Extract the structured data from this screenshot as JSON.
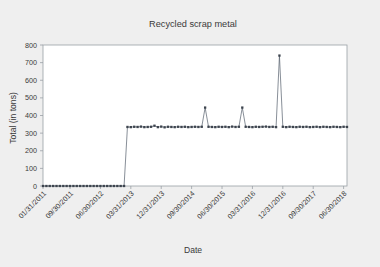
{
  "chart_data": {
    "type": "line",
    "title": "Recycled scrap metal",
    "xlabel": "Date",
    "ylabel": "Total (in tons)",
    "ylim": [
      0,
      800
    ],
    "yticks": [
      0,
      100,
      200,
      300,
      400,
      500,
      600,
      700,
      800
    ],
    "grid": false,
    "legend": "none",
    "marker": "square",
    "line_color": "#555f6b",
    "marker_color": "#3d444e",
    "plot_bg": "#ffffff",
    "figure_bg": "#efefef",
    "frame_color": "#9aa0a6",
    "xtick_labels": [
      "01/31/2011",
      "09/30/2011",
      "06/30/2012",
      "03/31/2013",
      "12/31/2013",
      "09/30/2014",
      "06/30/2015",
      "03/31/2016",
      "12/31/2016",
      "09/30/2017",
      "06/30/2018"
    ],
    "xtick_positions": [
      0,
      8,
      17,
      26,
      35,
      44,
      53,
      62,
      71,
      80,
      89
    ],
    "x_index_range": [
      0,
      90
    ],
    "series": [
      {
        "name": "Total",
        "x": [
          0,
          1,
          2,
          3,
          4,
          5,
          6,
          7,
          8,
          9,
          10,
          11,
          12,
          13,
          14,
          15,
          16,
          17,
          18,
          19,
          20,
          21,
          22,
          23,
          24,
          25,
          26,
          27,
          28,
          29,
          30,
          31,
          32,
          33,
          34,
          35,
          36,
          37,
          38,
          39,
          40,
          41,
          42,
          43,
          44,
          45,
          46,
          47,
          48,
          49,
          50,
          51,
          52,
          53,
          54,
          55,
          56,
          57,
          58,
          59,
          60,
          61,
          62,
          63,
          64,
          65,
          66,
          67,
          68,
          69,
          70,
          71,
          72,
          73,
          74,
          75,
          76,
          77,
          78,
          79,
          80,
          81,
          82,
          83,
          84,
          85,
          86,
          87,
          88,
          89,
          90
        ],
        "values": [
          0,
          0,
          0,
          0,
          0,
          0,
          0,
          0,
          0,
          0,
          0,
          0,
          0,
          0,
          0,
          0,
          0,
          0,
          0,
          0,
          0,
          0,
          0,
          0,
          0,
          335,
          334,
          336,
          335,
          337,
          334,
          335,
          336,
          342,
          334,
          337,
          333,
          336,
          335,
          334,
          336,
          335,
          336,
          334,
          335,
          336,
          335,
          336,
          445,
          336,
          335,
          334,
          336,
          335,
          336,
          334,
          337,
          335,
          336,
          445,
          336,
          335,
          334,
          336,
          335,
          336,
          337,
          335,
          336,
          334,
          740,
          336,
          334,
          336,
          335,
          334,
          336,
          335,
          336,
          334,
          335,
          336,
          334,
          336,
          335,
          334,
          336,
          335,
          334,
          336,
          335
        ]
      }
    ],
    "annotations": [
      {
        "label": "baseline segment",
        "value": 0,
        "x_start": 0,
        "x_end": 24
      },
      {
        "label": "step up to plateau",
        "value": 335,
        "x": 25
      },
      {
        "label": "peak",
        "value": 445,
        "x": 48
      },
      {
        "label": "peak",
        "value": 445,
        "x": 59
      },
      {
        "label": "peak",
        "value": 740,
        "x": 70
      }
    ]
  }
}
